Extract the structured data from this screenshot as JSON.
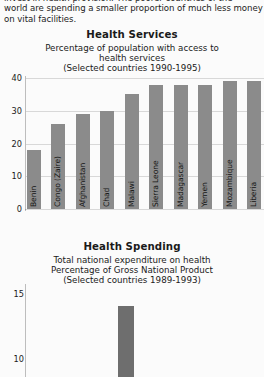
{
  "intro": {
    "lines": [
      "invest in health provision. The poorer countries of the",
      "world are spending a smaller proportion of much less money",
      "on vital facilities."
    ]
  },
  "chart_data": [
    {
      "type": "bar",
      "title": "Health Services",
      "subtitle_lines": [
        "Percentage of population with access to",
        "health services",
        "(Selected countries 1990-1995)"
      ],
      "xlabel": "",
      "ylabel": "",
      "ylim": [
        0,
        43
      ],
      "yticks": [
        0,
        10,
        20,
        30,
        40
      ],
      "grid": true,
      "legend": "none",
      "categories": [
        "Benin",
        "Congo (Zaire)",
        "Afghanistan",
        "Chad",
        "Malawi",
        "Sierra Leone",
        "Madagascar",
        "Yemen",
        "Mozambique",
        "Liberia"
      ],
      "values": [
        18,
        26,
        29,
        30,
        35,
        38,
        38,
        38,
        39,
        39
      ]
    },
    {
      "type": "bar",
      "title": "Health Spending",
      "subtitle_lines": [
        "Total national expenditure on health",
        "Percentage of Gross National Product",
        "(Selected countries 1989-1993)"
      ],
      "xlabel": "",
      "ylabel": "",
      "ylim": [
        8.6,
        15.8
      ],
      "yticks": [
        10,
        15
      ],
      "grid": false,
      "legend": "none",
      "categories": [
        "United States"
      ],
      "values": [
        14.1
      ],
      "note": "Chart is clipped by the bottom edge of the screenshot"
    }
  ]
}
